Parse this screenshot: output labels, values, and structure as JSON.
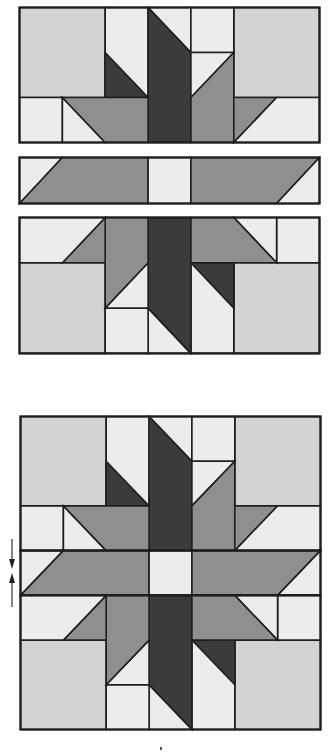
{
  "diagram": {
    "title": "",
    "colors": {
      "dark": "#3b3b3b",
      "medium": "#8f8f8f",
      "light": "#d3d3d3",
      "lightest": "#ececec",
      "outline": "#1e1e1e"
    },
    "grid": {
      "columns": 7
    },
    "sections": [
      {
        "id": "top-half-unit",
        "label": "Top half section (3 rows × 7 columns)"
      },
      {
        "id": "center-sash-strip",
        "label": "Center strip (1 row × 7 columns)"
      },
      {
        "id": "bottom-half-unit",
        "label": "Bottom half section (3 rows × 7 columns, rotated 180°)"
      },
      {
        "id": "assembled-block",
        "label": "Assembled star block (7 × 7)"
      }
    ],
    "annotations": {
      "seam_press_arrows": "Seam pressing direction arrows (up/down) at center strip seam",
      "bottom_mark": "small mark below assembled block"
    }
  }
}
